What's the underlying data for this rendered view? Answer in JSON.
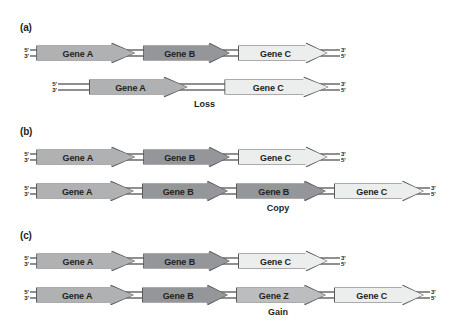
{
  "figure": {
    "background": "#ffffff",
    "end_labels": {
      "top_left": "5'",
      "bottom_left": "3'",
      "top_right": "3'",
      "bottom_right": "5'"
    },
    "colors": {
      "gene_a_fill": "#b0b1b3",
      "gene_b_fill": "#949699",
      "gene_c_fill": "#eceded",
      "gene_z_fill": "#bcbdbf",
      "outline": "#58595b",
      "dna_line": "#231f20",
      "text": "#231f20"
    }
  },
  "panels": [
    {
      "id": "a",
      "label": "(a)",
      "event": "Loss",
      "reference_row": {
        "genes": [
          {
            "name": "Gene A",
            "shade": "gene_a_fill"
          },
          {
            "name": "Gene B",
            "shade": "gene_b_fill"
          },
          {
            "name": "Gene C",
            "shade": "gene_c_fill"
          }
        ]
      },
      "variant_row": {
        "genes": [
          {
            "name": "Gene A",
            "shade": "gene_a_fill"
          },
          {
            "name": "Gene C",
            "shade": "gene_c_fill"
          }
        ]
      }
    },
    {
      "id": "b",
      "label": "(b)",
      "event": "Copy",
      "reference_row": {
        "genes": [
          {
            "name": "Gene A",
            "shade": "gene_a_fill"
          },
          {
            "name": "Gene B",
            "shade": "gene_b_fill"
          },
          {
            "name": "Gene C",
            "shade": "gene_c_fill"
          }
        ]
      },
      "variant_row": {
        "genes": [
          {
            "name": "Gene A",
            "shade": "gene_a_fill"
          },
          {
            "name": "Gene B",
            "shade": "gene_b_fill"
          },
          {
            "name": "Gene B",
            "shade": "gene_b_fill"
          },
          {
            "name": "Gene C",
            "shade": "gene_c_fill"
          }
        ]
      }
    },
    {
      "id": "c",
      "label": "(c)",
      "event": "Gain",
      "reference_row": {
        "genes": [
          {
            "name": "Gene A",
            "shade": "gene_a_fill"
          },
          {
            "name": "Gene B",
            "shade": "gene_b_fill"
          },
          {
            "name": "Gene C",
            "shade": "gene_c_fill"
          }
        ]
      },
      "variant_row": {
        "genes": [
          {
            "name": "Gene A",
            "shade": "gene_a_fill"
          },
          {
            "name": "Gene B",
            "shade": "gene_b_fill"
          },
          {
            "name": "Gene Z",
            "shade": "gene_z_fill"
          },
          {
            "name": "Gene C",
            "shade": "gene_c_fill"
          }
        ]
      }
    }
  ],
  "layout": {
    "rows": [
      {
        "panel": "a",
        "row": "reference",
        "left": 30,
        "width": 310,
        "top": 18
      },
      {
        "panel": "a",
        "row": "variant",
        "left": 58,
        "width": 282,
        "top": 52
      },
      {
        "panel": "b",
        "row": "reference",
        "left": 30,
        "width": 310,
        "top": 18
      },
      {
        "panel": "b",
        "row": "variant",
        "left": 30,
        "width": 400,
        "top": 52
      },
      {
        "panel": "c",
        "row": "reference",
        "left": 30,
        "width": 310,
        "top": 18
      },
      {
        "panel": "c",
        "row": "variant",
        "left": 30,
        "width": 400,
        "top": 52
      }
    ]
  }
}
